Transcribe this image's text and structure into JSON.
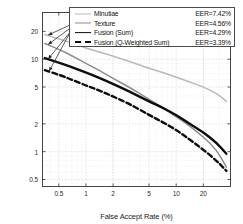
{
  "chart_data": {
    "type": "line",
    "title": "",
    "xlabel": "False Accept Rate (%)",
    "ylabel": "False Reject Rate (%)",
    "xscale": "log",
    "yscale": "log",
    "xlim": [
      0.33,
      40
    ],
    "ylim": [
      0.42,
      32
    ],
    "xticks": [
      0.5,
      1,
      2,
      5,
      10,
      20
    ],
    "xtick_labels": [
      "0.5",
      "1",
      "2",
      "5",
      "10",
      "20"
    ],
    "yticks": [
      0.5,
      1,
      2,
      5,
      10,
      20
    ],
    "ytick_labels": [
      "0.5",
      "1",
      "2",
      "5",
      "10",
      "20"
    ],
    "grid": true,
    "legend_position": "upper-right",
    "series": [
      {
        "name": "Minutiae",
        "eer_label": "EER=7.42%",
        "eer": 7.42,
        "color": "#b9b9b9",
        "style": "solid",
        "width": 1.5,
        "x": [
          0.35,
          0.5,
          0.7,
          1.0,
          1.4,
          2.0,
          3.0,
          5.0,
          7.0,
          10.0,
          14.0,
          20.0,
          28.0,
          36.0
        ],
        "y": [
          18.5,
          16.6,
          15.0,
          13.2,
          12.0,
          10.8,
          9.5,
          8.0,
          7.2,
          6.4,
          5.7,
          5.0,
          4.3,
          3.5
        ]
      },
      {
        "name": "Texture",
        "eer_label": "EER=4.56%",
        "eer": 4.56,
        "color": "#8d8d8d",
        "style": "solid",
        "width": 1.5,
        "x": [
          0.35,
          0.5,
          0.7,
          1.0,
          1.4,
          2.0,
          3.0,
          5.0,
          7.0,
          10.0,
          14.0,
          20.0,
          28.0,
          36.0
        ],
        "y": [
          14.8,
          12.8,
          10.9,
          9.0,
          7.6,
          6.2,
          5.0,
          3.7,
          3.0,
          2.4,
          1.9,
          1.45,
          1.05,
          0.68
        ]
      },
      {
        "name": "Fusion (Sum)",
        "eer_label": "EER=4.29%",
        "eer": 4.29,
        "color": "#0d0d0d",
        "style": "solid",
        "width": 2.4,
        "x": [
          0.35,
          0.5,
          0.7,
          1.0,
          1.4,
          2.0,
          3.0,
          5.0,
          7.0,
          10.0,
          14.0,
          20.0,
          28.0,
          36.0
        ],
        "y": [
          10.3,
          9.2,
          8.2,
          7.2,
          6.3,
          5.4,
          4.5,
          3.5,
          3.0,
          2.5,
          2.0,
          1.62,
          1.25,
          0.95
        ]
      },
      {
        "name": "Fusion (Q-Weighted Sum)",
        "eer_label": "EER=3.39%",
        "eer": 3.39,
        "color": "#0d0d0d",
        "style": "dashed",
        "width": 2.4,
        "x": [
          0.35,
          0.5,
          0.7,
          1.0,
          1.4,
          2.0,
          3.0,
          5.0,
          7.0,
          10.0,
          14.0,
          20.0,
          28.0,
          36.0
        ],
        "y": [
          7.6,
          6.8,
          6.0,
          5.2,
          4.6,
          3.95,
          3.3,
          2.5,
          2.1,
          1.72,
          1.36,
          1.05,
          0.8,
          0.62
        ]
      }
    ],
    "annotations": [
      {
        "name": "arrow-to-minutiae",
        "from_x": 1.15,
        "from_y": 30.0,
        "to_x": 0.38,
        "to_y": 18.2
      },
      {
        "name": "arrow-to-texture",
        "from_x": 1.05,
        "from_y": 30.0,
        "to_x": 0.38,
        "to_y": 14.4
      },
      {
        "name": "arrow-to-fusion-sum",
        "from_x": 0.95,
        "from_y": 30.0,
        "to_x": 0.38,
        "to_y": 10.0
      },
      {
        "name": "arrow-to-fusion-qsum",
        "from_x": 0.85,
        "from_y": 30.0,
        "to_x": 0.39,
        "to_y": 7.4
      }
    ]
  }
}
